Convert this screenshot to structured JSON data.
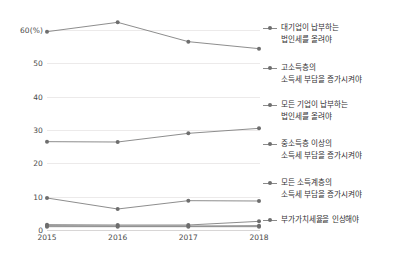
{
  "chart_data": {
    "type": "line",
    "title": "",
    "xlabel": "",
    "ylabel": "",
    "x": [
      "2015",
      "2016",
      "2017",
      "2018"
    ],
    "categories": [
      "2015",
      "2016",
      "2017",
      "2018"
    ],
    "ylim": [
      0,
      60
    ],
    "yticks": [
      0,
      10,
      20,
      30,
      40,
      50,
      60
    ],
    "ytick_labels": [
      "0",
      "10",
      "20",
      "30",
      "40",
      "50",
      "60(%)"
    ],
    "grid": "horizontal",
    "legend_position": "right",
    "marker": "circle",
    "line_color": "#808080",
    "marker_color": "#6e6e6e",
    "grid_color": "#eceaea",
    "text_color": "#4a4a4a",
    "series": [
      {
        "name": "대기업이 납부하는 법인세를 올려야",
        "name_line1": "대기업이 납부하는",
        "name_line2": "법인세를 올려야",
        "values": [
          59.5,
          62.3,
          56.5,
          54.4
        ]
      },
      {
        "name": "고소득층의 소득세 부담을 증가시켜야",
        "name_line1": "고소득층의",
        "name_line2": "소득세 부담을 증가시켜야",
        "values": [
          26.5,
          26.4,
          29.0,
          30.5
        ]
      },
      {
        "name": "모든 기업이 납부하는 법인세를 올려야",
        "name_line1": "모든 기업이 납부하는",
        "name_line2": "법인세를 올려야",
        "values": [
          9.6,
          6.3,
          8.8,
          8.7
        ]
      },
      {
        "name": "중소득층 이상의 소득세 부담을 증가시켜야",
        "name_line1": "중소득층 이상의",
        "name_line2": "소득세 부담을 증가시켜야",
        "values": [
          1.6,
          1.5,
          1.5,
          2.6
        ]
      },
      {
        "name": "모든 소득계층의 소득세 부담을 증가시켜야",
        "name_line1": "모든 소득계층의",
        "name_line2": "소득세 부담을 증가시켜야",
        "values": [
          1.3,
          1.2,
          1.2,
          1.3
        ]
      },
      {
        "name": "부가가치세율을 인상해야",
        "name_line1": "부가가치세율을 인상해야",
        "name_line2": "",
        "values": [
          1.0,
          1.0,
          1.0,
          1.0
        ]
      }
    ]
  }
}
